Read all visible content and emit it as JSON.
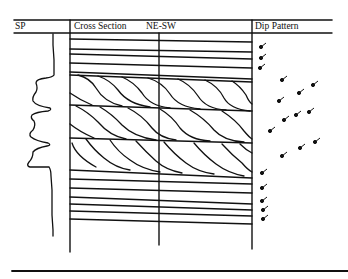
{
  "diagram": {
    "type": "well-log-cross-section",
    "columns": {
      "sp": {
        "label": "SP"
      },
      "cross_section": {
        "label": "Cross Section",
        "orientation": "NE-SW"
      },
      "dip_pattern": {
        "label": "Dip Pattern"
      }
    },
    "colors": {
      "ink": "#111111",
      "background": "#ffffff"
    }
  }
}
